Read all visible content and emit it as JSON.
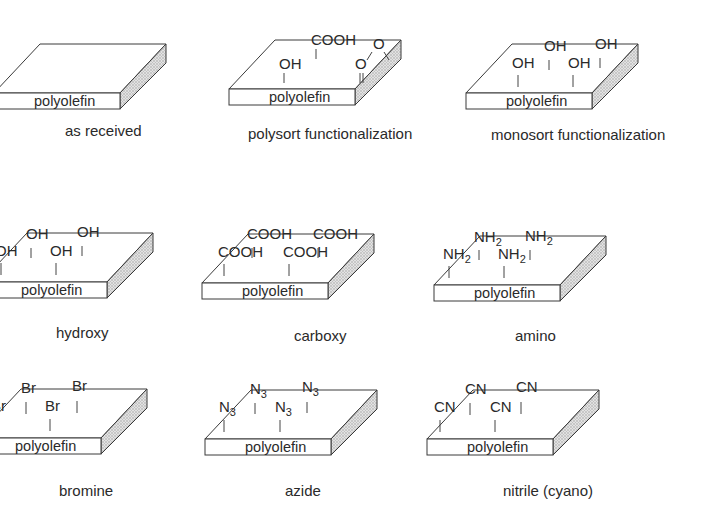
{
  "diagram": {
    "substrate_label": "polyolefin",
    "panels": [
      {
        "id": "as-received",
        "caption": "as received",
        "origin": [
          40,
          44
        ],
        "caption_pos": [
          65,
          136
        ],
        "groups": []
      },
      {
        "id": "polysort",
        "caption": "polysort functionalization",
        "origin": [
          275,
          40
        ],
        "caption_pos": [
          248,
          139
        ],
        "groups": [
          {
            "text": "OH",
            "sub": "",
            "x": 64,
            "y": 17,
            "bond_x": 69,
            "bond_y1": 21,
            "bond_y2": 31,
            "bond": "single"
          },
          {
            "text": "COOH",
            "sub": "",
            "x": 96,
            "y": -7,
            "bond_x": 101,
            "bond_y1": -3,
            "bond_y2": 7,
            "bond": "single"
          },
          {
            "text": "O",
            "sub": "",
            "x": 140,
            "y": 17,
            "bond_x": 145,
            "bond_y1": 21,
            "bond_y2": 31,
            "bond": "double"
          },
          {
            "text": "O",
            "sub": "",
            "x": 158,
            "y": -3,
            "bond": "ester"
          }
        ]
      },
      {
        "id": "monosort",
        "caption": "monosort functionalization",
        "origin": [
          512,
          44
        ],
        "caption_pos": [
          491,
          140
        ],
        "groups": [
          {
            "text": "OH",
            "sub": "",
            "x": 60,
            "y": 12,
            "bond_x": 66,
            "bond_y1": 19,
            "bond_y2": 31,
            "bond": "single"
          },
          {
            "text": "OH",
            "sub": "",
            "x": 92,
            "y": -5,
            "bond_x": 97,
            "bond_y1": 4,
            "bond_y2": 14,
            "bond": "single"
          },
          {
            "text": "OH",
            "sub": "",
            "x": 116,
            "y": 12,
            "bond_x": 121,
            "bond_y1": 19,
            "bond_y2": 31,
            "bond": "single"
          },
          {
            "text": "OH",
            "sub": "",
            "x": 143,
            "y": -7,
            "bond_x": 148,
            "bond_y1": 2,
            "bond_y2": 12,
            "bond": "single"
          }
        ]
      },
      {
        "id": "hydroxy",
        "caption": "hydroxy",
        "origin": [
          27,
          233
        ],
        "caption_pos": [
          56,
          338
        ],
        "groups": [
          {
            "text": "OH",
            "sub": "",
            "x": 28,
            "y": 11,
            "bond_x": 34,
            "bond_y1": 18,
            "bond_y2": 30,
            "bond": "single"
          },
          {
            "text": "OH",
            "sub": "",
            "x": 59,
            "y": -6,
            "bond_x": 64,
            "bond_y1": 3,
            "bond_y2": 13,
            "bond": "single"
          },
          {
            "text": "OH",
            "sub": "",
            "x": 83,
            "y": 11,
            "bond_x": 89,
            "bond_y1": 18,
            "bond_y2": 30,
            "bond": "single"
          },
          {
            "text": "OH",
            "sub": "",
            "x": 110,
            "y": -8,
            "bond_x": 115,
            "bond_y1": 1,
            "bond_y2": 11,
            "bond": "single"
          }
        ]
      },
      {
        "id": "carboxy",
        "caption": "carboxy",
        "origin": [
          248,
          234
        ],
        "caption_pos": [
          294,
          341
        ],
        "groups": [
          {
            "text": "COOH",
            "sub": "",
            "x": 30,
            "y": 11,
            "bond_x": 36,
            "bond_y1": 18,
            "bond_y2": 30,
            "bond": "single"
          },
          {
            "text": "COOH",
            "sub": "",
            "x": 59,
            "y": -7,
            "bond_x": 64,
            "bond_y1": 2,
            "bond_y2": 12,
            "bond": "single"
          },
          {
            "text": "COOH",
            "sub": "",
            "x": 95,
            "y": 11,
            "bond_x": 101,
            "bond_y1": 18,
            "bond_y2": 30,
            "bond": "single"
          },
          {
            "text": "COOH",
            "sub": "",
            "x": 125,
            "y": -7,
            "bond_x": 130,
            "bond_y1": 2,
            "bond_y2": 12,
            "bond": "single"
          }
        ]
      },
      {
        "id": "amino",
        "caption": "amino",
        "origin": [
          480,
          236
        ],
        "caption_pos": [
          515,
          341
        ],
        "groups": [
          {
            "text": "NH",
            "sub": "2",
            "x": 23,
            "y": 11,
            "bond_x": 29,
            "bond_y1": 18,
            "bond_y2": 30,
            "bond": "single"
          },
          {
            "text": "NH",
            "sub": "2",
            "x": 54,
            "y": -6,
            "bond_x": 59,
            "bond_y1": 2,
            "bond_y2": 12,
            "bond": "single"
          },
          {
            "text": "NH",
            "sub": "2",
            "x": 78,
            "y": 11,
            "bond_x": 84,
            "bond_y1": 18,
            "bond_y2": 30,
            "bond": "single"
          },
          {
            "text": "NH",
            "sub": "2",
            "x": 105,
            "y": -7,
            "bond_x": 110,
            "bond_y1": 2,
            "bond_y2": 12,
            "bond": "single"
          }
        ]
      },
      {
        "id": "bromine",
        "caption": "bromine",
        "origin": [
          21,
          389
        ],
        "caption_pos": [
          59,
          496
        ],
        "groups": [
          {
            "text": "Br",
            "sub": "",
            "x": 30,
            "y": 10,
            "bond_x": 34,
            "bond_y1": 18,
            "bond_y2": 30,
            "bond": "single"
          },
          {
            "text": "Br",
            "sub": "",
            "x": 60,
            "y": -8,
            "bond_x": 65,
            "bond_y1": 1,
            "bond_y2": 13,
            "bond": "single"
          },
          {
            "text": "Br",
            "sub": "",
            "x": 84,
            "y": 10,
            "bond_x": 89,
            "bond_y1": 18,
            "bond_y2": 30,
            "bond": "single"
          },
          {
            "text": "Br",
            "sub": "",
            "x": 111,
            "y": -10,
            "bond_x": 116,
            "bond_y1": 0,
            "bond_y2": 12,
            "bond": "single"
          }
        ]
      },
      {
        "id": "azide",
        "caption": "azide",
        "origin": [
          251,
          390
        ],
        "caption_pos": [
          285,
          496
        ],
        "groups": [
          {
            "text": "N",
            "sub": "3",
            "x": 28,
            "y": 10,
            "bond_x": 33,
            "bond_y1": 18,
            "bond_y2": 30,
            "bond": "single"
          },
          {
            "text": "N",
            "sub": "3",
            "x": 59,
            "y": -8,
            "bond_x": 64,
            "bond_y1": 1,
            "bond_y2": 12,
            "bond": "single"
          },
          {
            "text": "N",
            "sub": "3",
            "x": 84,
            "y": 10,
            "bond_x": 89,
            "bond_y1": 18,
            "bond_y2": 30,
            "bond": "single"
          },
          {
            "text": "N",
            "sub": "3",
            "x": 111,
            "y": -10,
            "bond_x": 116,
            "bond_y1": 0,
            "bond_y2": 11,
            "bond": "single"
          }
        ]
      },
      {
        "id": "nitrile",
        "caption": "nitrile (cyano)",
        "origin": [
          473,
          390
        ],
        "caption_pos": [
          503,
          496
        ],
        "groups": [
          {
            "text": "CN",
            "sub": "",
            "x": 21,
            "y": 10,
            "bond_x": 27,
            "bond_y1": 18,
            "bond_y2": 30,
            "bond": "single"
          },
          {
            "text": "CN",
            "sub": "",
            "x": 52,
            "y": -8,
            "bond_x": 57,
            "bond_y1": 1,
            "bond_y2": 13,
            "bond": "single"
          },
          {
            "text": "CN",
            "sub": "",
            "x": 77,
            "y": 10,
            "bond_x": 82,
            "bond_y1": 18,
            "bond_y2": 30,
            "bond": "single"
          },
          {
            "text": "CN",
            "sub": "",
            "x": 103,
            "y": -10,
            "bond_x": 108,
            "bond_y1": 0,
            "bond_y2": 12,
            "bond": "single"
          }
        ]
      }
    ],
    "slab_geometry": {
      "width": 126,
      "depth_dx": 46,
      "depth_dy": 49,
      "thickness": 16
    },
    "colors": {
      "line": "#3a3a3a",
      "text": "#2a2a2a",
      "side_fill": "#cfcfcf"
    }
  }
}
